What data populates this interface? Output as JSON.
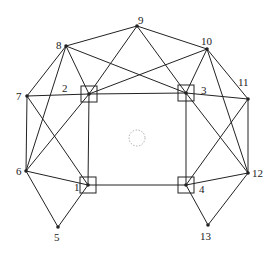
{
  "diagram": {
    "type": "graph",
    "nodes": [
      {
        "id": "1",
        "x": 88,
        "y": 185,
        "boxed": true,
        "lx": 74,
        "ly": 191
      },
      {
        "id": "2",
        "x": 89,
        "y": 94,
        "boxed": true,
        "lx": 62,
        "ly": 92
      },
      {
        "id": "3",
        "x": 186,
        "y": 93,
        "boxed": true,
        "lx": 201,
        "ly": 94
      },
      {
        "id": "4",
        "x": 186,
        "y": 185,
        "boxed": true,
        "lx": 199,
        "ly": 193
      },
      {
        "id": "5",
        "x": 58,
        "y": 227,
        "boxed": false,
        "lx": 54,
        "ly": 241
      },
      {
        "id": "6",
        "x": 26,
        "y": 171,
        "boxed": false,
        "lx": 16,
        "ly": 175
      },
      {
        "id": "7",
        "x": 27,
        "y": 96,
        "boxed": false,
        "lx": 16,
        "ly": 100
      },
      {
        "id": "8",
        "x": 66,
        "y": 46,
        "boxed": false,
        "lx": 56,
        "ly": 49
      },
      {
        "id": "9",
        "x": 137,
        "y": 26,
        "boxed": false,
        "lx": 138,
        "ly": 24
      },
      {
        "id": "10",
        "x": 207,
        "y": 49,
        "boxed": false,
        "lx": 201,
        "ly": 45
      },
      {
        "id": "11",
        "x": 248,
        "y": 99,
        "boxed": false,
        "lx": 238,
        "ly": 86
      },
      {
        "id": "12",
        "x": 248,
        "y": 173,
        "boxed": false,
        "lx": 252,
        "ly": 177
      },
      {
        "id": "13",
        "x": 208,
        "y": 225,
        "boxed": false,
        "lx": 200,
        "ly": 240
      }
    ],
    "edges": [
      [
        "8",
        "9"
      ],
      [
        "9",
        "10"
      ],
      [
        "8",
        "2"
      ],
      [
        "8",
        "3"
      ],
      [
        "8",
        "7"
      ],
      [
        "8",
        "6"
      ],
      [
        "9",
        "2"
      ],
      [
        "9",
        "3"
      ],
      [
        "10",
        "2"
      ],
      [
        "10",
        "3"
      ],
      [
        "10",
        "11"
      ],
      [
        "10",
        "12"
      ],
      [
        "7",
        "2"
      ],
      [
        "2",
        "3"
      ],
      [
        "3",
        "11"
      ],
      [
        "7",
        "6"
      ],
      [
        "7",
        "1"
      ],
      [
        "6",
        "2"
      ],
      [
        "6",
        "1"
      ],
      [
        "6",
        "5"
      ],
      [
        "2",
        "1"
      ],
      [
        "1",
        "4"
      ],
      [
        "1",
        "5"
      ],
      [
        "3",
        "4"
      ],
      [
        "3",
        "12"
      ],
      [
        "11",
        "12"
      ],
      [
        "11",
        "4"
      ],
      [
        "4",
        "12"
      ],
      [
        "4",
        "13"
      ],
      [
        "12",
        "13"
      ]
    ],
    "center_marker": {
      "x": 137,
      "y": 138,
      "r": 8
    }
  }
}
